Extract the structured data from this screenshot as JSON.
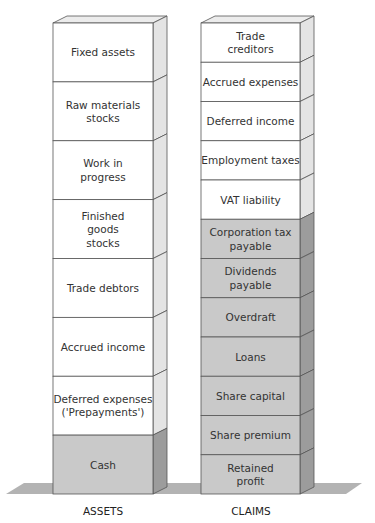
{
  "diagram": {
    "colors": {
      "white_front": "#ffffff",
      "white_side": "#e4e4e4",
      "white_top": "#ececec",
      "gray_front": "#c9c9c9",
      "gray_side": "#9c9c9c",
      "gray_top": "#b5b5b5",
      "shelf": "#b3b3b3",
      "edge": "#555555"
    },
    "columns": [
      {
        "id": "assets",
        "label": "ASSETS",
        "segments": [
          {
            "lines": [
              "Fixed assets"
            ],
            "shade": "white"
          },
          {
            "lines": [
              "Raw materials",
              "stocks"
            ],
            "shade": "white"
          },
          {
            "lines": [
              "Work in",
              "progress"
            ],
            "shade": "white"
          },
          {
            "lines": [
              "Finished",
              "goods",
              "stocks"
            ],
            "shade": "white"
          },
          {
            "lines": [
              "Trade debtors"
            ],
            "shade": "white"
          },
          {
            "lines": [
              "Accrued income"
            ],
            "shade": "white"
          },
          {
            "lines": [
              "Deferred expenses",
              "('Prepayments')"
            ],
            "shade": "white"
          },
          {
            "lines": [
              "Cash"
            ],
            "shade": "gray"
          }
        ]
      },
      {
        "id": "claims",
        "label": "CLAIMS",
        "segments": [
          {
            "lines": [
              "Trade",
              "creditors"
            ],
            "shade": "white"
          },
          {
            "lines": [
              "Accrued expenses"
            ],
            "shade": "white"
          },
          {
            "lines": [
              "Deferred income"
            ],
            "shade": "white"
          },
          {
            "lines": [
              "Employment taxes"
            ],
            "shade": "white"
          },
          {
            "lines": [
              "VAT liability"
            ],
            "shade": "white"
          },
          {
            "lines": [
              "Corporation tax",
              "payable"
            ],
            "shade": "gray"
          },
          {
            "lines": [
              "Dividends",
              "payable"
            ],
            "shade": "gray"
          },
          {
            "lines": [
              "Overdraft"
            ],
            "shade": "gray"
          },
          {
            "lines": [
              "Loans"
            ],
            "shade": "gray"
          },
          {
            "lines": [
              "Share capital"
            ],
            "shade": "gray"
          },
          {
            "lines": [
              "Share premium"
            ],
            "shade": "gray"
          },
          {
            "lines": [
              "Retained",
              "profit"
            ],
            "shade": "gray"
          }
        ]
      }
    ]
  }
}
